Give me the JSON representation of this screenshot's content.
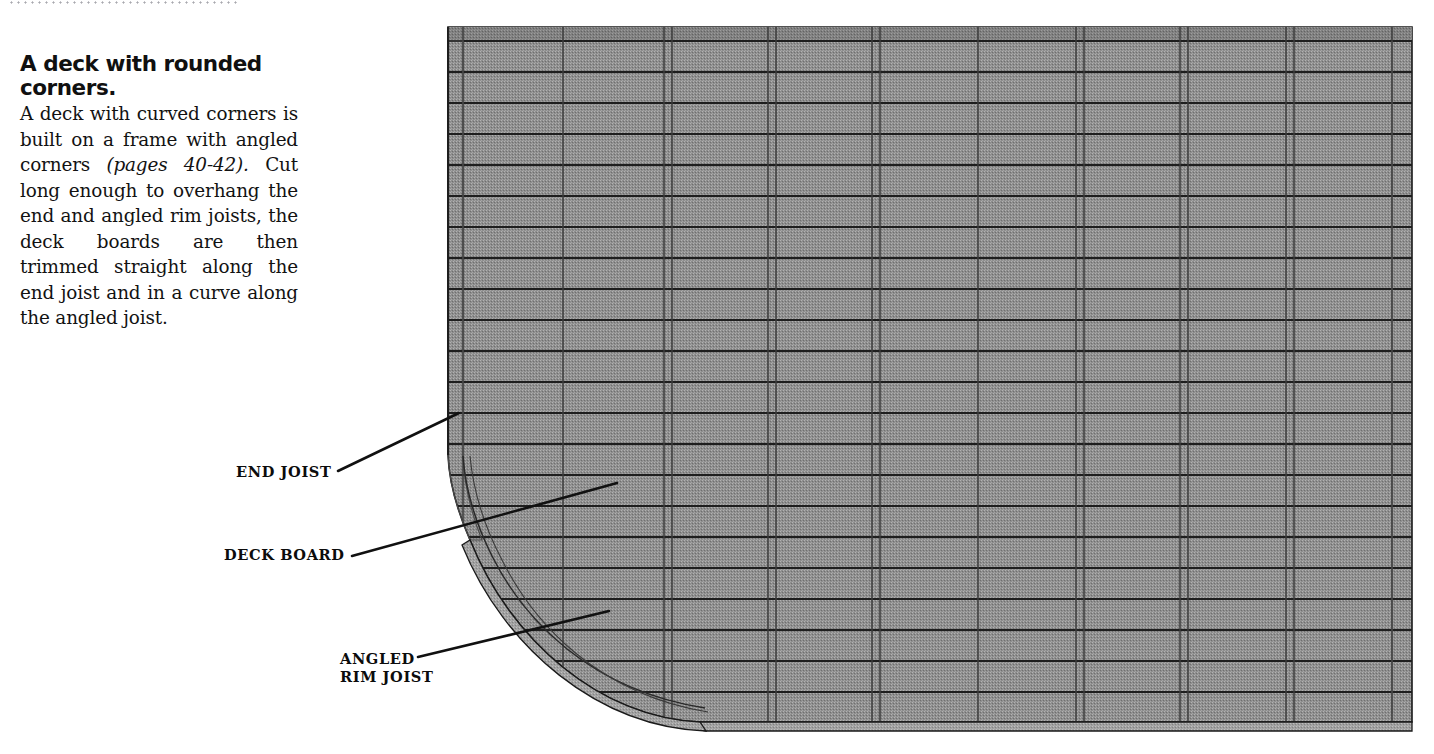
{
  "page": {
    "width": 1434,
    "height": 754,
    "background": "#ffffff",
    "top_rule": "dotted-rule"
  },
  "caption": {
    "heading": "A deck with rounded corners.",
    "body_part1": "A deck with curved corners is built on a frame with angled corners ",
    "body_italic": "(pages 40-42).",
    "body_part2": " Cut long enough to overhang the end and angled rim joists, the deck boards are then trimmed straight along the end joist and in a curve along the angled joist.",
    "body_full": "A deck with curved corners is built on a frame with angled corners (pages 40-42). Cut long enough to overhang the end and angled rim joists, the deck boards are then trimmed straight along the end joist and in a curve along the angled joist."
  },
  "callouts": [
    {
      "id": "end-joist",
      "label": "END JOIST",
      "leader_from": [
        338,
        471
      ],
      "leader_to": [
        459,
        413
      ]
    },
    {
      "id": "deck-board",
      "label": "DECK BOARD",
      "leader_from": [
        352,
        556
      ],
      "leader_to": [
        617,
        483
      ]
    },
    {
      "id": "angled-rim",
      "label": "ANGLED\nRIM JOIST",
      "leader_from": [
        418,
        657
      ],
      "leader_to": [
        609,
        611
      ]
    }
  ],
  "callout_labels": {
    "end_joist": "END JOIST",
    "deck_board": "DECK BOARD",
    "angled_rim_joist_line1": "ANGLED",
    "angled_rim_joist_line2": "RIM JOIST"
  },
  "illustration": {
    "name": "deck-with-rounded-corner-isometric",
    "colors": {
      "deck_face": "#8e8e8e",
      "deck_face_dark": "#7e7e7e",
      "deck_edge_band": "#9a9a9a",
      "fascia": "#a2a2a2",
      "outline": "#1a1a1a",
      "board_seam": "#1e1e1e",
      "joist_seam": "#3a3a3a",
      "leader_line": "#111111"
    },
    "geometry": {
      "top_y": 27,
      "bottom_y": 727,
      "left_x": 448,
      "right_x": 1412,
      "straight_left_bottom_y": 455,
      "curve_end_x": 697,
      "corner_radius_x": 250,
      "corner_radius_y": 272
    },
    "deck_boards": {
      "count": 22,
      "orientation": "horizontal",
      "first_seam_y": 58,
      "spacing_y": 30.6
    },
    "joist_seams": {
      "count": 9,
      "orientation": "vertical",
      "x_positions": [
        463,
        563,
        664,
        672,
        768,
        776,
        872,
        880,
        978,
        1076,
        1084,
        1180,
        1188,
        1286,
        1294,
        1392
      ]
    },
    "overhang_strips": {
      "left_strip_x": [
        448,
        463
      ],
      "right_strip_x": [
        1392,
        1412
      ]
    }
  }
}
